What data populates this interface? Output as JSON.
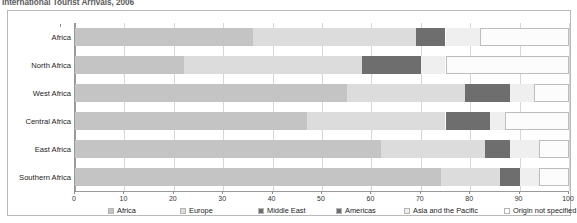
{
  "chart_data": {
    "type": "bar",
    "subtype": "stacked-horizontal-bar",
    "title": "International Tourist Arrivals, 2006",
    "xlabel": "",
    "ylabel": "",
    "xlim": [
      0,
      100
    ],
    "xticks": [
      0,
      10,
      20,
      30,
      40,
      50,
      60,
      70,
      80,
      90,
      100
    ],
    "grid": true,
    "legend_position": "bottom",
    "categories": [
      "Africa",
      "North Africa",
      "West Africa",
      "Central Africa",
      "East Africa",
      "Southern Africa"
    ],
    "series": [
      {
        "name": "Africa",
        "color": "#c4c4c4",
        "values": [
          36,
          22,
          55,
          47,
          62,
          74
        ]
      },
      {
        "name": "Europe",
        "color": "#dcdcdc",
        "values": [
          33,
          36,
          24,
          28,
          21,
          12
        ]
      },
      {
        "name": "Middle East",
        "color": "#6e6e6e",
        "values": [
          0,
          0,
          0,
          0,
          0,
          0
        ]
      },
      {
        "name": "Americas",
        "color": "#6e6e6e",
        "values": [
          6,
          12,
          9,
          9,
          5,
          4
        ]
      },
      {
        "name": "Asia and the Pacific",
        "color": "#efefef",
        "values": [
          7,
          5,
          5,
          3,
          6,
          4
        ]
      },
      {
        "name": "Origin not specified",
        "color": "#fcfcfc",
        "values": [
          18,
          25,
          7,
          13,
          6,
          6
        ]
      }
    ],
    "legend": [
      {
        "label": "Africa",
        "color": "#c4c4c4"
      },
      {
        "label": "Europe",
        "color": "#dcdcdc"
      },
      {
        "label": "Middle East",
        "color": "#6e6e6e"
      },
      {
        "label": "Americas",
        "color": "#6e6e6e"
      },
      {
        "label": "Asia and the Pacific",
        "color": "#efefef"
      },
      {
        "label": "Origin not specified",
        "color": "#fefefe"
      }
    ]
  }
}
